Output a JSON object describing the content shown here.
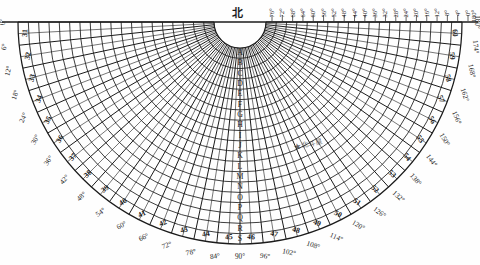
{
  "orientation_label": "北",
  "annotation": {
    "symbol": "★",
    "text": "北斗星"
  },
  "geometry": {
    "center_x": 240,
    "center_y": 22,
    "inner_radius": 26,
    "outer_radius": 222,
    "start_angle_deg": 180,
    "end_angle_deg": 360,
    "radial_step_deg": 6,
    "fine_radial_step_deg": 3,
    "arc_rings": 19
  },
  "colors": {
    "ink": "#1b1b1b",
    "paper": "#fefefe",
    "faint": "#3a3a3a"
  },
  "left_degrees": [
    "0°",
    "6°",
    "12°",
    "18°",
    "24°",
    "30°",
    "36°",
    "42°",
    "48°",
    "54°",
    "60°",
    "66°",
    "72°",
    "78°",
    "84°"
  ],
  "right_degrees": [
    "90°",
    "96°",
    "102°",
    "108°",
    "114°",
    "120°",
    "126°",
    "132°",
    "138°",
    "144°",
    "150°",
    "156°",
    "162°",
    "168°",
    "174°",
    "180°"
  ],
  "top_degrees": [
    "76°",
    "72°",
    "68°",
    "64°",
    "60°",
    "56°",
    "52°",
    "48°",
    "44°",
    "40°",
    "36°",
    "32°",
    "28°",
    "24°",
    "20°",
    "16°",
    "12°",
    "8°",
    "4°",
    "0°"
  ],
  "outer_numbers_left": [
    "31",
    "32",
    "33",
    "34",
    "35",
    "36",
    "37",
    "38",
    "39",
    "40",
    "41",
    "42",
    "43",
    "44",
    "45"
  ],
  "outer_numbers_right": [
    "46",
    "47",
    "48",
    "49",
    "50",
    "51",
    "52",
    "53",
    "54",
    "55",
    "56",
    "57",
    "58",
    "59",
    "60"
  ],
  "center_number": "45",
  "center_letter": "A",
  "ring_letters": [
    "A",
    "B",
    "C",
    "D",
    "E",
    "F",
    "G",
    "H",
    "I",
    "J",
    "K",
    "L",
    "M",
    "N",
    "O",
    "P",
    "Q",
    "R",
    "S"
  ],
  "chart_data": {
    "type": "polar-grid",
    "xlabel": "azimuth (degrees)",
    "ylabel": "radial ring (letters A–S)",
    "angular_ticks": [
      0,
      6,
      12,
      18,
      24,
      30,
      36,
      42,
      48,
      54,
      60,
      66,
      72,
      78,
      84,
      90,
      96,
      102,
      108,
      114,
      120,
      126,
      132,
      138,
      144,
      150,
      156,
      162,
      168,
      174,
      180
    ],
    "angular_tick_labels": [
      "0°",
      "6°",
      "12°",
      "18°",
      "24°",
      "30°",
      "36°",
      "42°",
      "48°",
      "54°",
      "60°",
      "66°",
      "72°",
      "78°",
      "84°",
      "90°",
      "96°",
      "102°",
      "108°",
      "114°",
      "120°",
      "126°",
      "132°",
      "138°",
      "144°",
      "150°",
      "156°",
      "162°",
      "168°",
      "174°",
      "180°"
    ],
    "top_edge_ticks": [
      76,
      72,
      68,
      64,
      60,
      56,
      52,
      48,
      44,
      40,
      36,
      32,
      28,
      24,
      20,
      16,
      12,
      8,
      4,
      0
    ],
    "perimeter_sector_numbers": [
      31,
      32,
      33,
      34,
      35,
      36,
      37,
      38,
      39,
      40,
      41,
      42,
      43,
      44,
      45,
      46,
      47,
      48,
      49,
      50,
      51,
      52,
      53,
      54,
      55,
      56,
      57,
      58,
      59,
      60
    ],
    "radial_rings": [
      "A",
      "B",
      "C",
      "D",
      "E",
      "F",
      "G",
      "H",
      "I",
      "J",
      "K",
      "L",
      "M",
      "N",
      "O",
      "P",
      "Q",
      "R",
      "S"
    ],
    "grid": true,
    "legend": "none",
    "annotations": [
      {
        "label": "北斗星",
        "symbol": "★",
        "angle_deg": 118,
        "ring": "L"
      }
    ]
  }
}
